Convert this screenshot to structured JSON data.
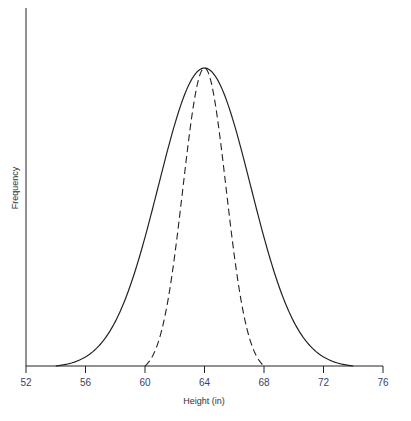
{
  "chart_data": {
    "type": "line",
    "title": "",
    "xlabel": "Height (in)",
    "ylabel": "Frequency",
    "xlim": [
      52,
      76
    ],
    "x_ticks": [
      52,
      56,
      60,
      64,
      68,
      72,
      76
    ],
    "grid": false,
    "legend": null,
    "series": [
      {
        "name": "wide distribution",
        "style": "solid",
        "mean": 64,
        "sd": 3.1,
        "x_range": [
          54,
          74
        ],
        "peak_relative": 1.0
      },
      {
        "name": "narrow distribution",
        "style": "dashed",
        "mean": 64,
        "sd": 1.45,
        "x_range": [
          60,
          68
        ],
        "peak_relative": 1.0
      }
    ]
  },
  "colors": {
    "line": "#222222",
    "axis": "#222222",
    "tick_label": "#3a3f6b"
  }
}
